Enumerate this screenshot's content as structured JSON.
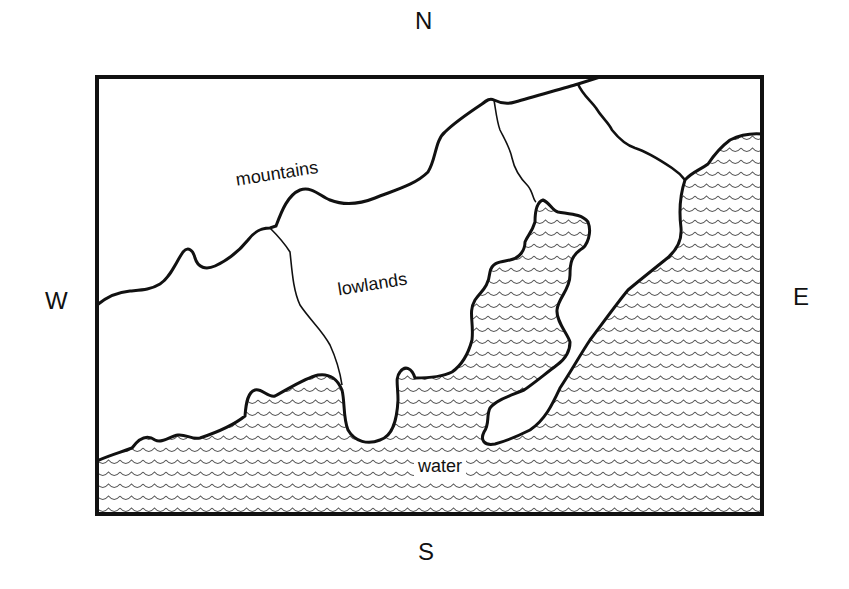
{
  "compass": {
    "north": "N",
    "south": "S",
    "east": "E",
    "west": "W"
  },
  "regions": {
    "mountains": "mountains",
    "lowlands": "lowlands",
    "water": "water"
  },
  "colors": {
    "line": "#111111",
    "wave": "#555555",
    "background": "#ffffff"
  }
}
